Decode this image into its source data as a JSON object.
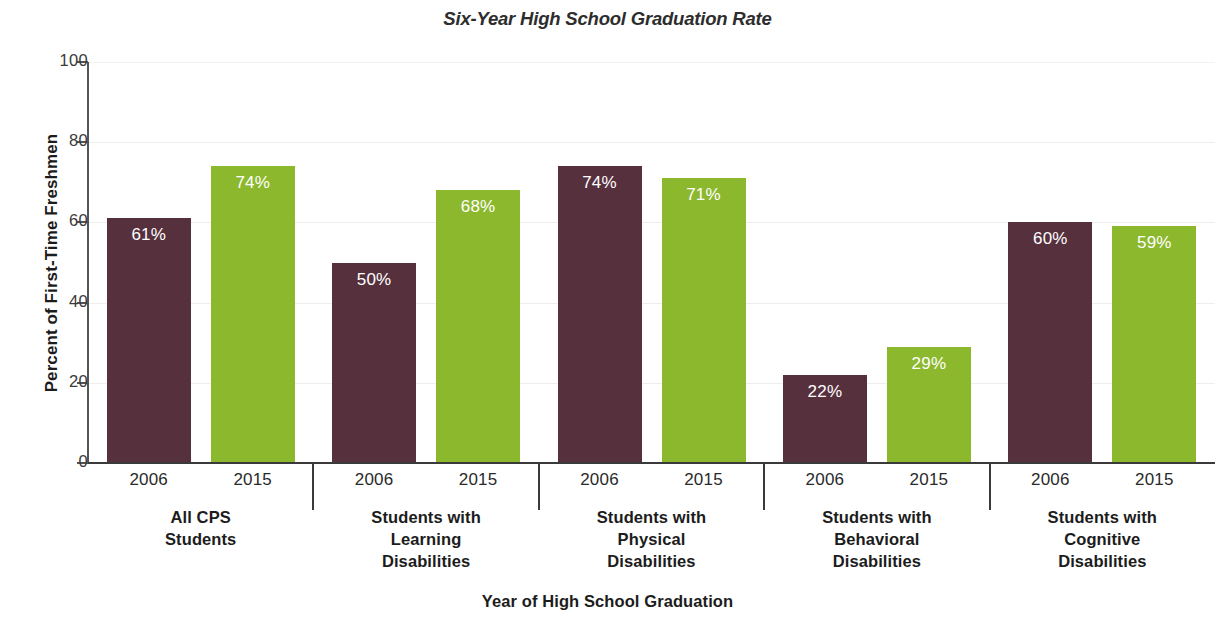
{
  "chart_data": {
    "type": "bar",
    "title": "Six-Year High School Graduation Rate",
    "xlabel": "Year of High School Graduation",
    "ylabel": "Percent of First-Time Freshmen",
    "ylim": [
      0,
      100
    ],
    "yticks": [
      0,
      20,
      40,
      60,
      80,
      100
    ],
    "ytick_labels": [
      "0",
      "20",
      "40",
      "60",
      "80",
      "100"
    ],
    "grid": true,
    "legend": "none",
    "categories": [
      "All CPS Students",
      "Students with Learning Disabilities",
      "Students with Physical Disabilities",
      "Students with Behavioral Disabilities",
      "Students with Cognitive Disabilities"
    ],
    "series": [
      {
        "name": "2006",
        "color": "#57303e",
        "values": [
          61,
          50,
          74,
          22,
          60
        ]
      },
      {
        "name": "2015",
        "color": "#8cb82e",
        "values": [
          74,
          68,
          71,
          29,
          59
        ]
      }
    ],
    "data_labels": [
      [
        "61%",
        "74%"
      ],
      [
        "50%",
        "68%"
      ],
      [
        "74%",
        "71%"
      ],
      [
        "22%",
        "29%"
      ],
      [
        "60%",
        "59%"
      ]
    ]
  },
  "groups": [
    {
      "caption_lines": [
        "All CPS",
        "Students"
      ],
      "bars": [
        {
          "year": "2006",
          "value": 61,
          "label": "61%",
          "series": "2006"
        },
        {
          "year": "2015",
          "value": 74,
          "label": "74%",
          "series": "2015"
        }
      ]
    },
    {
      "caption_lines": [
        "Students with",
        "Learning",
        "Disabilities"
      ],
      "bars": [
        {
          "year": "2006",
          "value": 50,
          "label": "50%",
          "series": "2006"
        },
        {
          "year": "2015",
          "value": 68,
          "label": "68%",
          "series": "2015"
        }
      ]
    },
    {
      "caption_lines": [
        "Students with",
        "Physical",
        "Disabilities"
      ],
      "bars": [
        {
          "year": "2006",
          "value": 74,
          "label": "74%",
          "series": "2006"
        },
        {
          "year": "2015",
          "value": 71,
          "label": "71%",
          "series": "2015"
        }
      ]
    },
    {
      "caption_lines": [
        "Students with",
        "Behavioral",
        "Disabilities"
      ],
      "bars": [
        {
          "year": "2006",
          "value": 22,
          "label": "22%",
          "series": "2006"
        },
        {
          "year": "2015",
          "value": 29,
          "label": "29%",
          "series": "2015"
        }
      ]
    },
    {
      "caption_lines": [
        "Students with",
        "Cognitive",
        "Disabilities"
      ],
      "bars": [
        {
          "year": "2006",
          "value": 60,
          "label": "60%",
          "series": "2006"
        },
        {
          "year": "2015",
          "value": 59,
          "label": "59%",
          "series": "2015"
        }
      ]
    }
  ],
  "colors": {
    "series_2006": "#57303e",
    "series_2015": "#8cb82e",
    "axis": "#3a3a3a",
    "grid": "#f0eeec",
    "text": "#1c1c1c",
    "value_label": "#ffffff",
    "background": "#ffffff"
  }
}
